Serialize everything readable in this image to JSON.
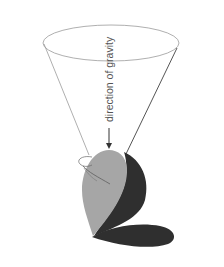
{
  "diagram": {
    "label": "direction of gravity",
    "elements": {
      "cone": {
        "description": "inverted cone of rotation axis",
        "stroke": "#8a8a8a"
      },
      "arrow": {
        "description": "downward arrow indicating gravity",
        "color": "#333333"
      },
      "light_lobe": {
        "description": "light grey teardrop lobe",
        "fill": "#a6a6a6"
      },
      "dark_lobe": {
        "description": "dark crescent lobe",
        "fill": "#2f2f2f"
      },
      "bottom_lobe": {
        "description": "dark horizontal lobe at the base",
        "fill": "#2f2f2f"
      },
      "rotation_marks": {
        "description": "small curved rotation arrow marks",
        "stroke": "#666666"
      }
    }
  },
  "colors": {
    "background": "#ffffff",
    "light": "#a6a6a6",
    "dark": "#2f2f2f",
    "line": "#8a8a8a",
    "text": "#555555"
  }
}
